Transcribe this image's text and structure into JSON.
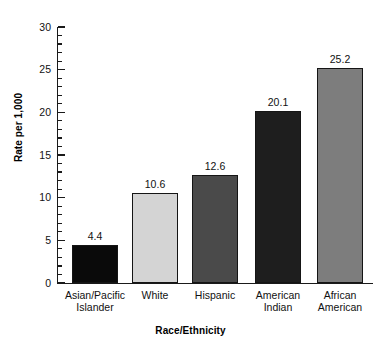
{
  "chart_data": {
    "type": "bar",
    "title": "",
    "xlabel": "Race/Ethnicity",
    "ylabel": "Rate per 1,000",
    "categories": [
      "Asian/Pacific Islander",
      "White",
      "Hispanic",
      "American Indian",
      "African American"
    ],
    "category_lines": [
      [
        "Asian/Pacific",
        "Islander"
      ],
      [
        "White",
        ""
      ],
      [
        "Hispanic",
        ""
      ],
      [
        "American",
        "Indian"
      ],
      [
        "African",
        "American"
      ]
    ],
    "values": [
      4.4,
      10.6,
      12.6,
      20.1,
      25.2
    ],
    "value_labels": [
      "4.4",
      "10.6",
      "12.6",
      "20.1",
      "25.2"
    ],
    "bar_colors": [
      "#0a0a0a",
      "#d4d4d4",
      "#4a4a4a",
      "#1e1e1e",
      "#7d7d7d"
    ],
    "ylim": [
      0,
      30
    ],
    "ytick_labels": [
      "0",
      "5",
      "10",
      "15",
      "20",
      "25",
      "30"
    ],
    "ytick_values": [
      0,
      5,
      10,
      15,
      20,
      25,
      30
    ],
    "yminor_step": 1,
    "grid": false,
    "legend": "none"
  }
}
